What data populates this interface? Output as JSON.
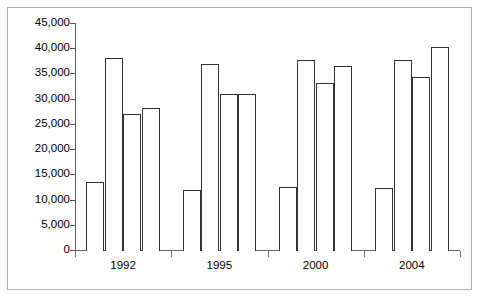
{
  "chart_data": {
    "type": "bar",
    "title": "",
    "subtitle": "",
    "xlabel": "",
    "ylabel": "",
    "ylim": [
      0,
      45000
    ],
    "grid": false,
    "legend": "none",
    "ytick_labels": [
      "45,000",
      "40,000",
      "35,000",
      "30,000",
      "25,000",
      "20,000",
      "15,000",
      "10,000",
      "5,000",
      "0"
    ],
    "ytick_values": [
      45000,
      40000,
      35000,
      30000,
      25000,
      20000,
      15000,
      10000,
      5000,
      0
    ],
    "categories": [
      "1992",
      "1995",
      "2000",
      "2004"
    ],
    "bars": [
      {
        "group": "1992",
        "index": 0,
        "value": 13400
      },
      {
        "group": "1992",
        "index": 1,
        "value": 38000
      },
      {
        "group": "1992",
        "index": 2,
        "value": 27000
      },
      {
        "group": "1992",
        "index": 3,
        "value": 28100
      },
      {
        "group": "1995",
        "index": 0,
        "value": 11800
      },
      {
        "group": "1995",
        "index": 1,
        "value": 36800
      },
      {
        "group": "1995",
        "index": 2,
        "value": 30900
      },
      {
        "group": "1995",
        "index": 3,
        "value": 30900
      },
      {
        "group": "2000",
        "index": 0,
        "value": 12400
      },
      {
        "group": "2000",
        "index": 1,
        "value": 37700
      },
      {
        "group": "2000",
        "index": 2,
        "value": 33200
      },
      {
        "group": "2000",
        "index": 3,
        "value": 36400
      },
      {
        "group": "2004",
        "index": 0,
        "value": 12300
      },
      {
        "group": "2004",
        "index": 1,
        "value": 37600
      },
      {
        "group": "2004",
        "index": 2,
        "value": 34200
      },
      {
        "group": "2004",
        "index": 3,
        "value": 40300
      }
    ],
    "series": [
      {
        "name": "bar-1",
        "values": [
          13400,
          11800,
          12400,
          12300
        ]
      },
      {
        "name": "bar-2",
        "values": [
          38000,
          36800,
          37700,
          37600
        ]
      },
      {
        "name": "bar-3",
        "values": [
          27000,
          30900,
          33200,
          34200
        ]
      },
      {
        "name": "bar-4",
        "values": [
          28100,
          30900,
          36400,
          40300
        ]
      }
    ],
    "colors": {
      "bar_fill": "#ffffff",
      "bar_stroke": "#333333",
      "axis": "#666666",
      "frame": "#b0b0b0",
      "text": "#000000",
      "background": "#ffffff"
    }
  },
  "layout": {
    "plot_left": 75,
    "plot_right": 460,
    "baseline_y": 250,
    "top_y": 23,
    "group_count": 4,
    "bars_per_group": 4
  }
}
